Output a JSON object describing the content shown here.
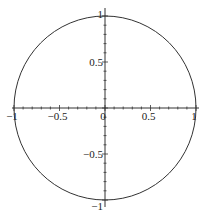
{
  "chart_data": {
    "type": "line",
    "title": "",
    "xlabel": "",
    "ylabel": "",
    "xlim": [
      -1,
      1
    ],
    "ylim": [
      -1,
      1
    ],
    "grid": false,
    "legend": null,
    "axes_style": "centered-cross",
    "x_ticks": [
      -1,
      -0.5,
      0,
      0.5,
      1
    ],
    "x_tick_labels": [
      "-1",
      "-0.5",
      "0",
      "0.5",
      "1"
    ],
    "y_ticks": [
      -1,
      -0.5,
      0.5,
      1
    ],
    "y_tick_labels": [
      "-1",
      "-0.5",
      "0.5",
      "1"
    ],
    "minor_tick_step": 0.1,
    "series": [
      {
        "name": "unit circle",
        "equation": "x^2 + y^2 = 1",
        "center": [
          0,
          0
        ],
        "radius": 1,
        "color": "#333333"
      }
    ]
  }
}
